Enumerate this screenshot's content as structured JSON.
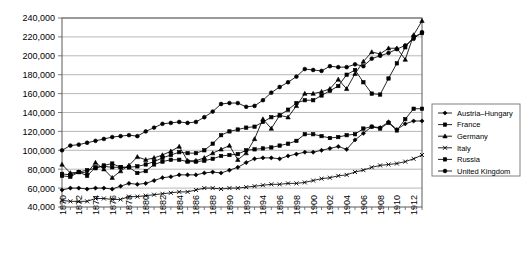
{
  "chart_data": {
    "type": "line",
    "title": "",
    "xlabel": "",
    "ylabel": "",
    "xlim": [
      1870,
      1913
    ],
    "ylim": [
      40000,
      240000
    ],
    "grid": true,
    "legend_position": "right",
    "ytick_labels": [
      "240,000",
      "220,000",
      "200,000",
      "180,000",
      "160,000",
      "140,000",
      "120,000",
      "100,000",
      "80,000",
      "60,000",
      "40,000"
    ],
    "yticks": [
      240000,
      220000,
      200000,
      180000,
      160000,
      140000,
      120000,
      100000,
      80000,
      60000,
      40000
    ],
    "xtick_labels": [
      "1870",
      "1872",
      "1874",
      "1876",
      "1878",
      "1880",
      "1882",
      "1884",
      "1886",
      "1888",
      "1890",
      "1892",
      "1894",
      "1896",
      "1898",
      "1900",
      "1902",
      "1904",
      "1906",
      "1908",
      "1910",
      "1912"
    ],
    "xticks": [
      1870,
      1872,
      1874,
      1876,
      1878,
      1880,
      1882,
      1884,
      1886,
      1888,
      1890,
      1892,
      1894,
      1896,
      1898,
      1900,
      1902,
      1904,
      1906,
      1908,
      1910,
      1912
    ],
    "x": [
      1870,
      1871,
      1872,
      1873,
      1874,
      1875,
      1876,
      1877,
      1878,
      1879,
      1880,
      1881,
      1882,
      1883,
      1884,
      1885,
      1886,
      1887,
      1888,
      1889,
      1890,
      1891,
      1892,
      1893,
      1894,
      1895,
      1896,
      1897,
      1898,
      1899,
      1900,
      1901,
      1902,
      1903,
      1904,
      1905,
      1906,
      1907,
      1908,
      1909,
      1910,
      1911,
      1912,
      1913
    ],
    "series": [
      {
        "name": "Austria-Hungary",
        "marker": "diamond",
        "values": [
          58000,
          60000,
          60000,
          59000,
          60000,
          60000,
          59000,
          62000,
          65000,
          64000,
          65000,
          68000,
          71000,
          72000,
          74000,
          74000,
          74000,
          76000,
          77000,
          76000,
          79000,
          82000,
          87000,
          91000,
          92000,
          92000,
          91000,
          94000,
          96000,
          98000,
          98000,
          100000,
          102000,
          104000,
          101000,
          111000,
          118000,
          125000,
          124000,
          130000,
          122000,
          128000,
          131000,
          131000
        ]
      },
      {
        "name": "France",
        "marker": "square",
        "values": [
          73000,
          72000,
          77000,
          73000,
          82000,
          83000,
          82000,
          82000,
          82000,
          76000,
          78000,
          85000,
          88000,
          90000,
          90000,
          88000,
          88000,
          89000,
          91000,
          94000,
          95000,
          96000,
          100000,
          101000,
          102000,
          103000,
          105000,
          107000,
          110000,
          117000,
          117000,
          115000,
          113000,
          114000,
          116000,
          117000,
          123000,
          125000,
          123000,
          129000,
          121000,
          133000,
          144000,
          144000
        ]
      },
      {
        "name": "Germany",
        "marker": "triangle",
        "values": [
          85000,
          76000,
          77000,
          76000,
          87000,
          80000,
          71000,
          78000,
          84000,
          93000,
          90000,
          92000,
          95000,
          99000,
          104000,
          89000,
          89000,
          92000,
          97000,
          101000,
          105000,
          90000,
          97000,
          112000,
          133000,
          123000,
          137000,
          135000,
          147000,
          160000,
          160000,
          162000,
          165000,
          175000,
          165000,
          181000,
          194000,
          204000,
          202000,
          208000,
          208000,
          196000,
          222000,
          237000
        ]
      },
      {
        "name": "Italy",
        "marker": "x",
        "values": [
          47000,
          46000,
          46000,
          46000,
          49000,
          49000,
          48000,
          48000,
          51000,
          51000,
          52000,
          53000,
          54000,
          55000,
          56000,
          56000,
          58000,
          60000,
          60000,
          59000,
          60000,
          60000,
          61000,
          62000,
          63000,
          64000,
          64000,
          65000,
          65000,
          66000,
          68000,
          70000,
          71000,
          73000,
          74000,
          77000,
          79000,
          82000,
          84000,
          85000,
          86000,
          88000,
          91000,
          95000
        ]
      },
      {
        "name": "Russia",
        "marker": "square",
        "values": [
          75000,
          74000,
          77000,
          79000,
          81000,
          84000,
          86000,
          82000,
          82000,
          83000,
          85000,
          88000,
          92000,
          95000,
          98000,
          97000,
          97000,
          100000,
          107000,
          116000,
          120000,
          122000,
          124000,
          125000,
          130000,
          135000,
          137000,
          143000,
          150000,
          153000,
          153000,
          158000,
          163000,
          168000,
          180000,
          185000,
          172000,
          160000,
          159000,
          176000,
          192000,
          209000,
          220000,
          224000
        ]
      },
      {
        "name": "United Kingdom",
        "marker": "circle",
        "values": [
          100000,
          105000,
          106000,
          108000,
          110000,
          112000,
          114000,
          115000,
          116000,
          115000,
          120000,
          124000,
          128000,
          129000,
          130000,
          129000,
          130000,
          135000,
          141000,
          149000,
          150000,
          150000,
          146000,
          147000,
          153000,
          161000,
          167000,
          172000,
          178000,
          186000,
          185000,
          184000,
          189000,
          188000,
          188000,
          191000,
          189000,
          197000,
          200000,
          203000,
          207000,
          211000,
          218000,
          225000
        ]
      }
    ]
  },
  "legend": {
    "items": [
      {
        "label": "Austria–Hungary",
        "marker": "diamond"
      },
      {
        "label": "France",
        "marker": "square"
      },
      {
        "label": "Germany",
        "marker": "triangle"
      },
      {
        "label": "Italy",
        "marker": "x"
      },
      {
        "label": "Russia",
        "marker": "square"
      },
      {
        "label": "United Kingdom",
        "marker": "circle"
      }
    ]
  }
}
